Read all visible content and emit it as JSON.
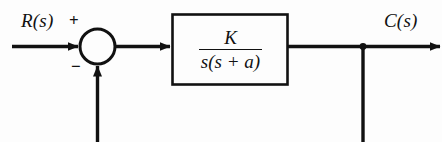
{
  "diagram": {
    "type": "control-system-block-diagram",
    "background_color": "#fdfdfd",
    "line_color": "#111111",
    "canvas": {
      "width": 442,
      "height": 142
    },
    "input": {
      "label": "R(s)",
      "sign_at_summer": "+"
    },
    "output": {
      "label": "C(s)"
    },
    "summing_junction": {
      "name": "summing-junction",
      "shape": "circle",
      "cx": 97.5,
      "cy": 46.5,
      "r": 17.5,
      "positive_sign": "+",
      "negative_sign": "−"
    },
    "plant_block": {
      "name": "transfer-function-block",
      "x": 172,
      "y": 14,
      "width": 116,
      "height": 71,
      "transfer_function": {
        "numerator": "K",
        "denominator": "s(s + a)",
        "full": "K / s(s + a)"
      }
    },
    "takeoff_point": {
      "name": "takeoff-junction-dot",
      "cx": 363,
      "cy": 46,
      "r": 3.2
    },
    "feedback_path": {
      "name": "unity-feedback-path",
      "gain": "1",
      "direction": "right-to-left",
      "cropped_at_bottom": true
    },
    "signal_line_y": 46
  }
}
